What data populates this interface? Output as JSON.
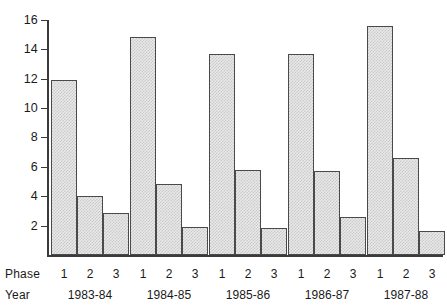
{
  "labels": {
    "phase_row_label": "Phase",
    "year_row_label": "Year"
  },
  "chart_data": {
    "type": "bar",
    "title": "",
    "xlabel": "",
    "ylabel": "",
    "ylim": [
      0,
      16
    ],
    "y_ticks": [
      2,
      4,
      6,
      8,
      10,
      12,
      14,
      16
    ],
    "y_tick_labels": [
      "2",
      "4",
      "6",
      "8",
      "10",
      "12",
      "14",
      "16"
    ],
    "grid": false,
    "legend": null,
    "group_label_name": "Year",
    "series_label_name": "Phase",
    "categories": [
      "1983-84",
      "1984-85",
      "1985-86",
      "1986-87",
      "1987-88"
    ],
    "phases": [
      "1",
      "2",
      "3"
    ],
    "series": [
      {
        "name": "1",
        "values": [
          11.9,
          14.85,
          13.7,
          13.7,
          15.6
        ]
      },
      {
        "name": "2",
        "values": [
          4.0,
          4.85,
          5.8,
          5.7,
          6.6
        ]
      },
      {
        "name": "3",
        "values": [
          2.85,
          1.9,
          1.85,
          2.6,
          1.6
        ]
      }
    ],
    "groups": [
      {
        "year": "1983-84",
        "bars": [
          {
            "phase": "1",
            "value": 11.9
          },
          {
            "phase": "2",
            "value": 4.0
          },
          {
            "phase": "3",
            "value": 2.85
          }
        ]
      },
      {
        "year": "1984-85",
        "bars": [
          {
            "phase": "1",
            "value": 14.85
          },
          {
            "phase": "2",
            "value": 4.85
          },
          {
            "phase": "3",
            "value": 1.9
          }
        ]
      },
      {
        "year": "1985-86",
        "bars": [
          {
            "phase": "1",
            "value": 13.7
          },
          {
            "phase": "2",
            "value": 5.8
          },
          {
            "phase": "3",
            "value": 1.85
          }
        ]
      },
      {
        "year": "1986-87",
        "bars": [
          {
            "phase": "1",
            "value": 13.7
          },
          {
            "phase": "2",
            "value": 5.7
          },
          {
            "phase": "3",
            "value": 2.6
          }
        ]
      },
      {
        "year": "1987-88",
        "bars": [
          {
            "phase": "1",
            "value": 15.6
          },
          {
            "phase": "2",
            "value": 6.6
          },
          {
            "phase": "3",
            "value": 1.6
          }
        ]
      }
    ],
    "colors": {
      "bar_fill": "#e9e9e9",
      "bar_hatch": "#c9c9c9",
      "bar_border": "#4a4a4a",
      "axis": "#3a3a3a",
      "text": "#1a1a1a",
      "background": "#ffffff"
    }
  }
}
